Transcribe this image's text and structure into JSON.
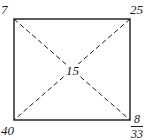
{
  "diagram": {
    "type": "rectangle with diagonals",
    "colors": {
      "stroke": "#1a1a1a",
      "background": "#ffffff"
    },
    "labels": {
      "top_left": "7",
      "top_right": "25",
      "center": "15",
      "bottom_left": "40",
      "bottom_right_fraction": {
        "numerator": "8",
        "denominator": "33"
      }
    }
  }
}
